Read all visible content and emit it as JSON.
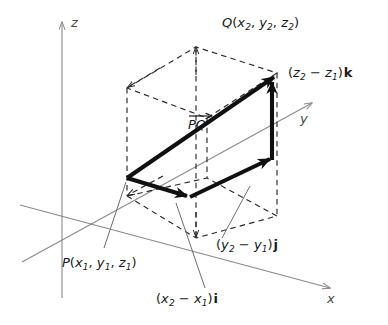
{
  "figure": {
    "type": "vector-diagram-3d",
    "background_color": "#ffffff",
    "stroke_color": "#1a1a1a",
    "axis_color": "#8a8a8a",
    "leader_color": "#6e6e6e"
  },
  "axes": {
    "z": {
      "label": "z"
    },
    "y": {
      "label": "y"
    },
    "x": {
      "label": "x"
    }
  },
  "points": {
    "P": {
      "name": "P",
      "open_paren": "(",
      "x": "x",
      "x_sub": "1",
      "y": "y",
      "y_sub": "1",
      "z": "z",
      "z_sub": "1",
      "close_paren": ")",
      "comma": ","
    },
    "Q": {
      "name": "Q",
      "open_paren": "(",
      "x": "x",
      "x_sub": "2",
      "y": "y",
      "y_sub": "2",
      "z": "z",
      "z_sub": "2",
      "close_paren": ")",
      "comma": ","
    }
  },
  "vector": {
    "label_p": "P",
    "label_q": "Q"
  },
  "components": {
    "i": {
      "open_paren": "(",
      "term1": "x",
      "term1_sub": "2",
      "operator": "−",
      "term2": "x",
      "term2_sub": "1",
      "close_paren": ")",
      "unit": "i"
    },
    "j": {
      "open_paren": "(",
      "term1": "y",
      "term1_sub": "2",
      "operator": "−",
      "term2": "y",
      "term2_sub": "1",
      "close_paren": ")",
      "unit": "j"
    },
    "k": {
      "open_paren": "(",
      "term1": "z",
      "term1_sub": "2",
      "operator": "−",
      "term2": "z",
      "term2_sub": "1",
      "close_paren": ")",
      "unit": "k"
    }
  }
}
